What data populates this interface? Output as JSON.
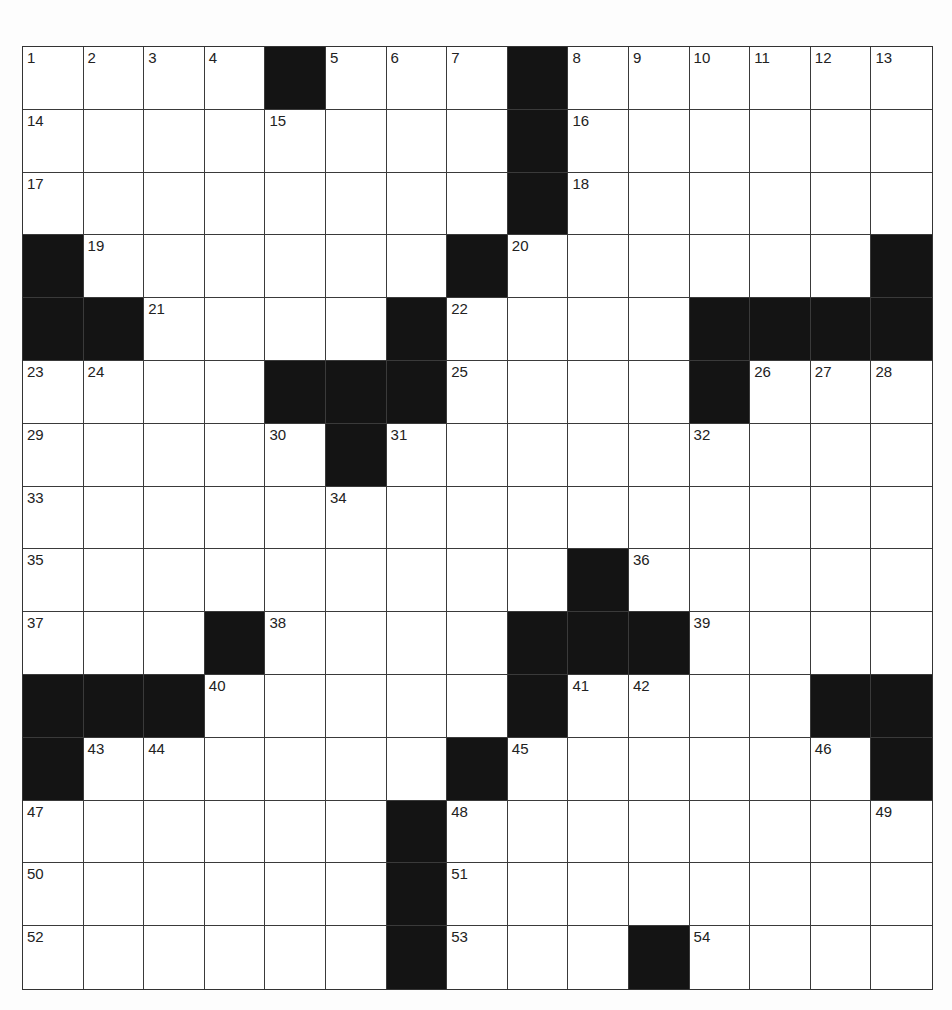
{
  "puzzle": {
    "rows": 15,
    "cols": 15,
    "colors": {
      "block": "#141414",
      "cell": "#ffffff",
      "line": "#3a3a3a",
      "number": "#222222"
    },
    "layout": [
      "1234#567#89ABCD",
      ".....",
      ""
    ],
    "grid": [
      [
        {
          "n": "1"
        },
        {
          "n": "2"
        },
        {
          "n": "3"
        },
        {
          "n": "4"
        },
        {
          "b": 1
        },
        {
          "n": "5"
        },
        {
          "n": "6"
        },
        {
          "n": "7"
        },
        {
          "b": 1
        },
        {
          "n": "8"
        },
        {
          "n": "9"
        },
        {
          "n": "10"
        },
        {
          "n": "11"
        },
        {
          "n": "12"
        },
        {
          "n": "13"
        }
      ],
      [
        {
          "n": "14"
        },
        {},
        {},
        {},
        {
          "n": "15"
        },
        {},
        {},
        {},
        {
          "b": 1
        },
        {
          "n": "16"
        },
        {},
        {},
        {},
        {},
        {}
      ],
      [
        {
          "n": "17"
        },
        {},
        {},
        {},
        {},
        {},
        {},
        {},
        {
          "b": 1
        },
        {
          "n": "18"
        },
        {},
        {},
        {},
        {},
        {}
      ],
      [
        {
          "b": 1
        },
        {
          "n": "19"
        },
        {},
        {},
        {},
        {},
        {},
        {
          "b": 1
        },
        {
          "n": "20"
        },
        {},
        {},
        {},
        {},
        {},
        {
          "b": 1
        }
      ],
      [
        {
          "b": 1
        },
        {
          "b": 1
        },
        {
          "n": "21"
        },
        {},
        {},
        {},
        {
          "b": 1
        },
        {
          "n": "22"
        },
        {},
        {},
        {},
        {
          "b": 1
        },
        {
          "b": 1
        },
        {
          "b": 1
        },
        {
          "b": 1
        }
      ],
      [
        {
          "n": "23"
        },
        {
          "n": "24"
        },
        {},
        {},
        {
          "b": 1
        },
        {
          "b": 1
        },
        {
          "b": 1
        },
        {
          "n": "25"
        },
        {},
        {},
        {},
        {
          "b": 1
        },
        {
          "n": "26"
        },
        {
          "n": "27"
        },
        {
          "n": "28"
        }
      ],
      [
        {
          "n": "29"
        },
        {},
        {},
        {},
        {
          "n": "30"
        },
        {
          "b": 1
        },
        {
          "n": "31"
        },
        {},
        {},
        {},
        {},
        {
          "n": "32"
        },
        {},
        {},
        {}
      ],
      [
        {
          "n": "33"
        },
        {},
        {},
        {},
        {},
        {
          "n": "34"
        },
        {},
        {},
        {},
        {},
        {},
        {},
        {},
        {},
        {}
      ],
      [
        {
          "n": "35"
        },
        {},
        {},
        {},
        {},
        {},
        {},
        {},
        {},
        {
          "b": 1
        },
        {
          "n": "36"
        },
        {},
        {},
        {},
        {}
      ],
      [
        {
          "n": "37"
        },
        {},
        {},
        {
          "b": 1
        },
        {
          "n": "38"
        },
        {},
        {},
        {},
        {
          "b": 1
        },
        {
          "b": 1
        },
        {
          "b": 1
        },
        {
          "n": "39"
        },
        {},
        {},
        {}
      ],
      [
        {
          "b": 1
        },
        {
          "b": 1
        },
        {
          "b": 1
        },
        {
          "n": "40"
        },
        {},
        {},
        {},
        {},
        {
          "b": 1
        },
        {
          "n": "41"
        },
        {
          "n": "42"
        },
        {},
        {},
        {
          "b": 1
        },
        {
          "b": 1
        }
      ],
      [
        {
          "b": 1
        },
        {
          "n": "43"
        },
        {
          "n": "44"
        },
        {},
        {},
        {},
        {},
        {
          "b": 1
        },
        {
          "n": "45"
        },
        {},
        {},
        {},
        {},
        {
          "n": "46"
        },
        {
          "b": 1
        }
      ],
      [
        {
          "n": "47"
        },
        {},
        {},
        {},
        {},
        {},
        {
          "b": 1
        },
        {
          "n": "48"
        },
        {},
        {},
        {},
        {},
        {},
        {},
        {
          "n": "49"
        }
      ],
      [
        {
          "n": "50"
        },
        {},
        {},
        {},
        {},
        {},
        {
          "b": 1
        },
        {
          "n": "51"
        },
        {},
        {},
        {},
        {},
        {},
        {},
        {}
      ],
      [
        {
          "n": "52"
        },
        {},
        {},
        {},
        {},
        {},
        {
          "b": 1
        },
        {
          "n": "53"
        },
        {},
        {},
        {
          "b": 1
        },
        {
          "n": "54"
        },
        {},
        {},
        {}
      ]
    ],
    "clue_numbers": [
      "1",
      "2",
      "3",
      "4",
      "5",
      "6",
      "7",
      "8",
      "9",
      "10",
      "11",
      "12",
      "13",
      "14",
      "15",
      "16",
      "17",
      "18",
      "19",
      "20",
      "21",
      "22",
      "23",
      "24",
      "25",
      "26",
      "27",
      "28",
      "29",
      "30",
      "31",
      "32",
      "33",
      "34",
      "35",
      "36",
      "37",
      "38",
      "39",
      "40",
      "41",
      "42",
      "43",
      "44",
      "45",
      "46",
      "47",
      "48",
      "49",
      "50",
      "51",
      "52",
      "53",
      "54"
    ]
  }
}
